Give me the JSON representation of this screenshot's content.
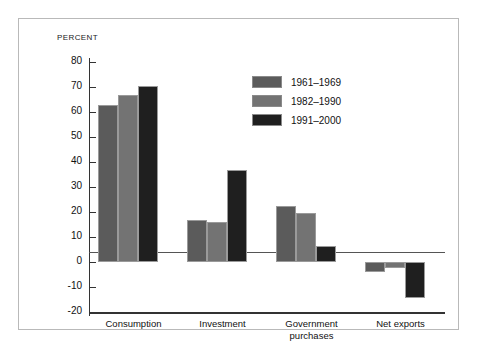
{
  "chart_data": {
    "type": "bar",
    "title": "",
    "subtitle": "",
    "xlabel": "",
    "ylabel": "PERCENT",
    "ylim": [
      -20,
      80
    ],
    "yticks": [
      80,
      70,
      60,
      50,
      40,
      30,
      20,
      10,
      0,
      -10,
      -20
    ],
    "ytick_labels": [
      "80",
      "70",
      "60",
      "50",
      "40",
      "30",
      "20",
      "10",
      "0",
      "-10",
      "-20"
    ],
    "grid": false,
    "legend_position": "upper-center-right",
    "categories": [
      "Consumption",
      "Investment",
      "Government\npurchases",
      "Net exports"
    ],
    "series": [
      {
        "name": "1961–1969",
        "color": "#5b5b5b",
        "values": [
          63,
          17,
          22.5,
          -4
        ]
      },
      {
        "name": "1982–1990",
        "color": "#737373",
        "values": [
          67,
          16,
          19.5,
          -2.5
        ]
      },
      {
        "name": "1991–2000",
        "color": "#1f1f1f",
        "values": [
          70.5,
          37,
          6.5,
          -14.5
        ]
      }
    ],
    "annotations": []
  },
  "colors": {
    "frame_border": "#b9b9b9",
    "axis": "#333333",
    "zero_line": "#555555",
    "background": "#ffffff",
    "text": "#111111"
  }
}
